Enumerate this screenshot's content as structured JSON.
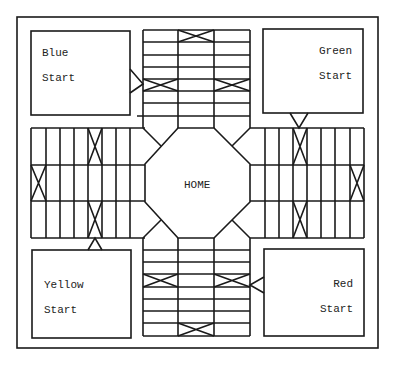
{
  "board": {
    "center_label": "HOME",
    "line_color": "#1a1a1a",
    "background": "#ffffff"
  },
  "start_areas": [
    {
      "id": "blue",
      "line1": "Blue",
      "line2": "Start",
      "position": "top-left"
    },
    {
      "id": "green",
      "line1": "Green",
      "line2": "Start",
      "position": "top-right"
    },
    {
      "id": "yellow",
      "line1": "Yellow",
      "line2": "Start",
      "position": "bottom-left"
    },
    {
      "id": "red",
      "line1": "Red",
      "line2": "Start",
      "position": "bottom-right"
    }
  ],
  "tracks": {
    "top": {
      "columns": 3,
      "rows": 8,
      "crossed_cells": [
        [
          0,
          1
        ],
        [
          4,
          0
        ],
        [
          4,
          2
        ]
      ]
    },
    "bottom": {
      "columns": 3,
      "rows": 8,
      "crossed_cells": [
        [
          2,
          0
        ],
        [
          2,
          2
        ],
        [
          6,
          1
        ]
      ]
    },
    "left": {
      "columns": 8,
      "rows": 3,
      "crossed_cells": [
        [
          0,
          4
        ],
        [
          1,
          0
        ],
        [
          2,
          4
        ]
      ]
    },
    "right": {
      "columns": 8,
      "rows": 3,
      "crossed_cells": [
        [
          0,
          3
        ],
        [
          1,
          7
        ],
        [
          2,
          3
        ]
      ]
    }
  }
}
